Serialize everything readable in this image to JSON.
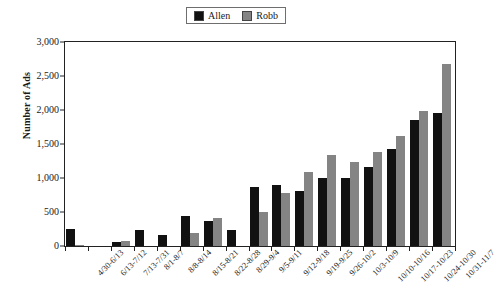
{
  "chart_data": {
    "type": "bar",
    "title": "",
    "xlabel": "",
    "ylabel": "Number of Ads",
    "ylim": [
      0,
      3000
    ],
    "yticks": [
      0,
      500,
      1000,
      1500,
      2000,
      2500,
      3000
    ],
    "ytick_labels": [
      "0",
      "500",
      "1,000",
      "1,500",
      "2,000",
      "2,500",
      "3,000"
    ],
    "grid": false,
    "legend_position": "top-center",
    "categories": [
      "4/30-6/13",
      "6/13-7/12",
      "7/13-7/31",
      "8/1-8/7",
      "8/8-8/14",
      "8/15-8/21",
      "8/22-8/28",
      "8/29-9/4",
      "9/5-9/11",
      "9/12-9/18",
      "9/19-9/25",
      "9/26-10/2",
      "10/3-10/9",
      "10/10-10/16",
      "10/17-10/23",
      "10/24-10/30",
      "10/31-11/7"
    ],
    "series": [
      {
        "name": "Allen",
        "color": "#111111",
        "values": [
          245,
          0,
          55,
          232,
          160,
          447,
          362,
          232,
          870,
          900,
          808,
          995,
          995,
          1160,
          1432,
          1850,
          1958
        ]
      },
      {
        "name": "Robb",
        "color": "#848484",
        "values": [
          8,
          0,
          78,
          0,
          0,
          192,
          415,
          0,
          495,
          780,
          1085,
          1338,
          1238,
          1382,
          1622,
          1980,
          2680
        ]
      }
    ]
  },
  "legend": {
    "entries": [
      {
        "label": "Allen",
        "color": "#111111"
      },
      {
        "label": "Robb",
        "color": "#848484"
      }
    ]
  },
  "axes": {
    "y_axis_title": "Number of Ads"
  }
}
